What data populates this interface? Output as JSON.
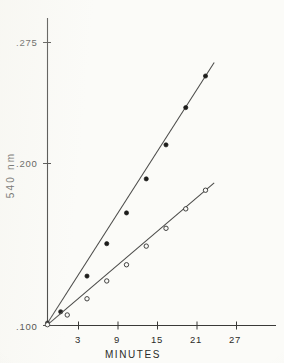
{
  "figure": {
    "background_color": "#fbfbf8",
    "ink_color": "#2b2b29"
  },
  "axes": {
    "y_title": "540 nm",
    "x_title": "MINUTES",
    "y_ticks": [
      {
        "label": ".275",
        "value": 0.275
      },
      {
        "label": ".200",
        "value": 0.2
      },
      {
        "label": ".100",
        "value": 0.1
      }
    ],
    "x_ticks": [
      {
        "label": "3",
        "value": 3
      },
      {
        "label": "9",
        "value": 9
      },
      {
        "label": "15",
        "value": 15
      },
      {
        "label": "21",
        "value": 21
      },
      {
        "label": "27",
        "value": 27
      }
    ]
  },
  "chart_data": {
    "type": "line",
    "title": "",
    "subtitle": "",
    "xlabel": "MINUTES",
    "ylabel": "540 nm",
    "xlim": [
      0,
      30
    ],
    "ylim": [
      0.1,
      0.285
    ],
    "xticks": [
      3,
      9,
      15,
      21,
      27
    ],
    "yticks": [
      0.1,
      0.2,
      0.275
    ],
    "grid": false,
    "legend": "none",
    "x_axis_note": "axis drawn from 0 at origin; tick labels every 6 minutes",
    "y_axis_note": "absorbance at 540 nm; origin of plot is .100",
    "series": [
      {
        "name": "upper-curve-filled-circles",
        "marker": "filled-circle",
        "x": [
          0,
          2,
          6,
          9,
          12,
          15,
          18,
          21,
          24
        ],
        "y": [
          0.1015,
          0.1085,
          0.1305,
          0.1505,
          0.1695,
          0.1905,
          0.2115,
          0.2345,
          0.254
        ]
      },
      {
        "name": "lower-curve-open-circles",
        "marker": "open-circle",
        "x": [
          0,
          3,
          6,
          9,
          12,
          15,
          18,
          21,
          24
        ],
        "y": [
          0.1005,
          0.1065,
          0.1165,
          0.1275,
          0.1375,
          0.149,
          0.16,
          0.172,
          0.1835
        ]
      }
    ]
  }
}
